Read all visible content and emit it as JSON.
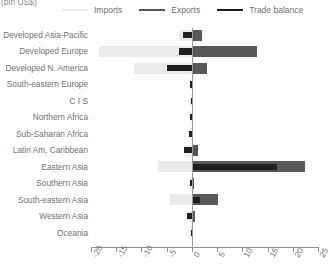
{
  "unit_label": "(bln US$)",
  "legend": {
    "items": [
      {
        "name": "imports",
        "label": "Imports",
        "color": "#ebebeb"
      },
      {
        "name": "exports",
        "label": "Exports",
        "color": "#585858"
      },
      {
        "name": "trade-balance",
        "label": "Trade balance",
        "color": "#1f1f1f"
      }
    ]
  },
  "chart_data": {
    "type": "bar",
    "orientation": "horizontal",
    "title": "",
    "subtitle": "",
    "xlabel": "(bln US$)",
    "ylabel": "",
    "xlim": [
      -20,
      25
    ],
    "xticks": [
      -20,
      -15,
      -10,
      -5,
      0,
      5,
      10,
      15,
      20,
      25
    ],
    "xtick_labels": [
      "-20",
      "-15",
      "-10",
      "-5",
      "0",
      "5",
      "10",
      "15",
      "20",
      "25"
    ],
    "grid": false,
    "legend_position": "top",
    "categories": [
      "Developed Asia-Pacific",
      "Developed Europe",
      "Developed N. America",
      "South-eastern Europe",
      "C I S",
      "Northern Africa",
      "Sub-Saharan Africa",
      "Latin Am, Caribbean",
      "Eastern Asia",
      "Southern Asia",
      "South-eastern Asia",
      "Western Asia",
      "Oceania"
    ],
    "series": [
      {
        "name": "Imports",
        "color": "#ebebeb",
        "note": "plotted as negative values extending left of zero",
        "values": [
          -2.6,
          -18.4,
          -11.4,
          -0.2,
          -0.3,
          -0.2,
          -0.3,
          -1.3,
          -6.8,
          -0.5,
          -4.3,
          -0.7,
          -0.1
        ]
      },
      {
        "name": "Exports",
        "color": "#585858",
        "values": [
          2.1,
          13.0,
          3.0,
          0.2,
          0.1,
          0.2,
          0.3,
          1.2,
          22.4,
          0.5,
          5.2,
          0.6,
          0.1
        ]
      },
      {
        "name": "Trade balance",
        "color": "#1f1f1f",
        "note": "bar spans from zero toward balance value; negative = deficit",
        "values": [
          -1.8,
          -2.6,
          -5.0,
          -0.3,
          -0.2,
          -0.3,
          -0.5,
          -1.6,
          16.8,
          -0.4,
          1.6,
          -0.9,
          -0.2
        ]
      }
    ]
  }
}
